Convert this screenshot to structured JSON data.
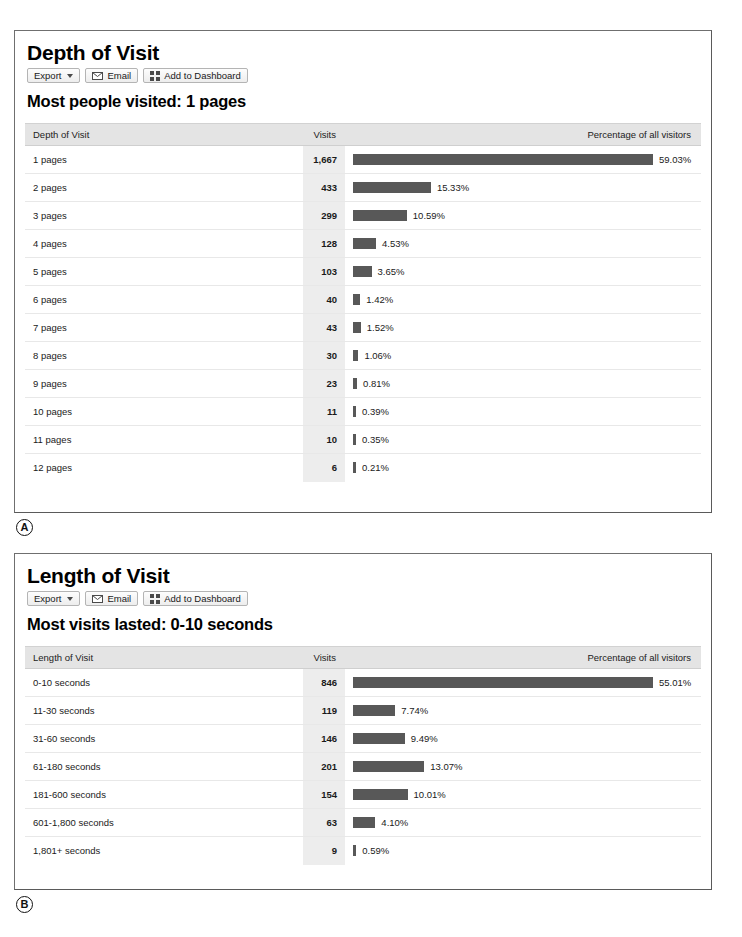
{
  "toolbar": {
    "export_label": "Export",
    "export_icon": "chevron-down-icon",
    "email_label": "Email",
    "email_icon": "envelope-icon",
    "dashboard_label": "Add to Dashboard",
    "dashboard_icon": "grid-icon"
  },
  "colors": {
    "bar": "#585858",
    "header_bg": "#e4e4e4",
    "visits_col_bg": "#ededed",
    "panel_border": "#6f6f6f"
  },
  "panels": [
    {
      "marker": "A",
      "title": "Depth of Visit",
      "summary": "Most people visited: 1 pages",
      "columns": [
        "Depth of Visit",
        "Visits",
        "Percentage of all visitors"
      ],
      "rows": [
        {
          "label": "1 pages",
          "visits": "1,667",
          "pct": "59.03%",
          "pct_value": 59.03
        },
        {
          "label": "2 pages",
          "visits": "433",
          "pct": "15.33%",
          "pct_value": 15.33
        },
        {
          "label": "3 pages",
          "visits": "299",
          "pct": "10.59%",
          "pct_value": 10.59
        },
        {
          "label": "4 pages",
          "visits": "128",
          "pct": "4.53%",
          "pct_value": 4.53
        },
        {
          "label": "5 pages",
          "visits": "103",
          "pct": "3.65%",
          "pct_value": 3.65
        },
        {
          "label": "6 pages",
          "visits": "40",
          "pct": "1.42%",
          "pct_value": 1.42
        },
        {
          "label": "7 pages",
          "visits": "43",
          "pct": "1.52%",
          "pct_value": 1.52
        },
        {
          "label": "8 pages",
          "visits": "30",
          "pct": "1.06%",
          "pct_value": 1.06
        },
        {
          "label": "9 pages",
          "visits": "23",
          "pct": "0.81%",
          "pct_value": 0.81
        },
        {
          "label": "10 pages",
          "visits": "11",
          "pct": "0.39%",
          "pct_value": 0.39
        },
        {
          "label": "11 pages",
          "visits": "10",
          "pct": "0.35%",
          "pct_value": 0.35
        },
        {
          "label": "12 pages",
          "visits": "6",
          "pct": "0.21%",
          "pct_value": 0.21
        }
      ]
    },
    {
      "marker": "B",
      "title": "Length of Visit",
      "summary": "Most visits lasted: 0-10 seconds",
      "columns": [
        "Length of Visit",
        "Visits",
        "Percentage of all visitors"
      ],
      "rows": [
        {
          "label": "0-10 seconds",
          "visits": "846",
          "pct": "55.01%",
          "pct_value": 55.01
        },
        {
          "label": "11-30 seconds",
          "visits": "119",
          "pct": "7.74%",
          "pct_value": 7.74
        },
        {
          "label": "31-60 seconds",
          "visits": "146",
          "pct": "9.49%",
          "pct_value": 9.49
        },
        {
          "label": "61-180 seconds",
          "visits": "201",
          "pct": "13.07%",
          "pct_value": 13.07
        },
        {
          "label": "181-600 seconds",
          "visits": "154",
          "pct": "10.01%",
          "pct_value": 10.01
        },
        {
          "label": "601-1,800 seconds",
          "visits": "63",
          "pct": "4.10%",
          "pct_value": 4.1
        },
        {
          "label": "1,801+ seconds",
          "visits": "9",
          "pct": "0.59%",
          "pct_value": 0.59
        }
      ]
    }
  ],
  "chart_data": [
    {
      "type": "bar",
      "title": "Depth of Visit",
      "xlabel": "Depth of Visit",
      "ylabel": "Percentage of all visitors",
      "categories": [
        "1 pages",
        "2 pages",
        "3 pages",
        "4 pages",
        "5 pages",
        "6 pages",
        "7 pages",
        "8 pages",
        "9 pages",
        "10 pages",
        "11 pages",
        "12 pages"
      ],
      "values": [
        59.03,
        15.33,
        10.59,
        4.53,
        3.65,
        1.42,
        1.52,
        1.06,
        0.81,
        0.39,
        0.35,
        0.21
      ],
      "counts": [
        1667,
        433,
        299,
        128,
        103,
        40,
        43,
        30,
        23,
        11,
        10,
        6
      ],
      "ylim": [
        0,
        100
      ],
      "grid": false,
      "legend": "none"
    },
    {
      "type": "bar",
      "title": "Length of Visit",
      "xlabel": "Length of Visit",
      "ylabel": "Percentage of all visitors",
      "categories": [
        "0-10 seconds",
        "11-30 seconds",
        "31-60 seconds",
        "61-180 seconds",
        "181-600 seconds",
        "601-1,800 seconds",
        "1,801+ seconds"
      ],
      "values": [
        55.01,
        7.74,
        9.49,
        13.07,
        10.01,
        4.1,
        0.59
      ],
      "counts": [
        846,
        119,
        146,
        201,
        154,
        63,
        9
      ],
      "ylim": [
        0,
        100
      ],
      "grid": false,
      "legend": "none"
    }
  ]
}
